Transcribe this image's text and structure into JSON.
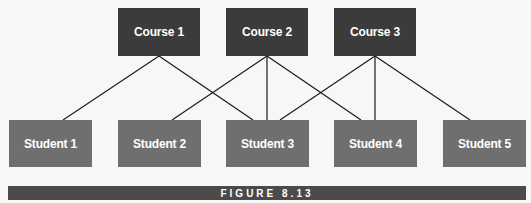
{
  "diagram": {
    "type": "bipartite-many-to-many",
    "colors": {
      "course_fill": "#3b3b3b",
      "student_fill": "#6f6f6f",
      "edge": "#1a1a1a",
      "caption_bar": "#4a4a4a",
      "text": "#ffffff",
      "background": "#f7f7f7"
    },
    "courses": [
      {
        "id": "c1",
        "label": "Course 1"
      },
      {
        "id": "c2",
        "label": "Course 2"
      },
      {
        "id": "c3",
        "label": "Course 3"
      }
    ],
    "students": [
      {
        "id": "s1",
        "label": "Student 1"
      },
      {
        "id": "s2",
        "label": "Student 2"
      },
      {
        "id": "s3",
        "label": "Student 3"
      },
      {
        "id": "s4",
        "label": "Student 4"
      },
      {
        "id": "s5",
        "label": "Student 5"
      }
    ],
    "edges": [
      {
        "from": "Course 1",
        "to": "Student 1"
      },
      {
        "from": "Course 1",
        "to": "Student 3"
      },
      {
        "from": "Course 2",
        "to": "Student 2"
      },
      {
        "from": "Course 2",
        "to": "Student 3"
      },
      {
        "from": "Course 2",
        "to": "Student 4"
      },
      {
        "from": "Course 3",
        "to": "Student 3"
      },
      {
        "from": "Course 3",
        "to": "Student 4"
      },
      {
        "from": "Course 3",
        "to": "Student 5"
      }
    ]
  },
  "caption": {
    "label": "FIGURE 8.13"
  }
}
